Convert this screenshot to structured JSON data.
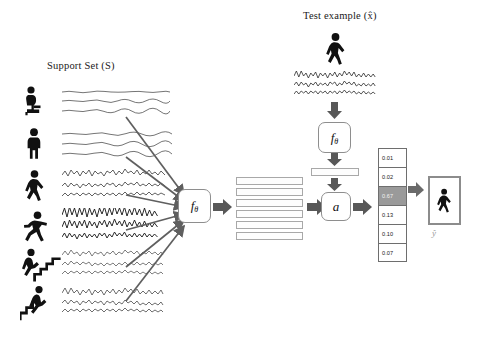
{
  "figure": {
    "type": "method-diagram",
    "title_support": "Support Set (S)",
    "title_test": "Test example (x̂)",
    "prediction_label": "ŷ"
  },
  "support_set": {
    "label": "Support Set (S)",
    "classes": [
      {
        "icon": "person-sitting-icon",
        "name": "sitting",
        "signal_rows": 3,
        "signal_style": "flat-smooth"
      },
      {
        "icon": "person-standing-icon",
        "name": "standing",
        "signal_rows": 3,
        "signal_style": "flat-smooth"
      },
      {
        "icon": "person-walking-icon",
        "name": "walking",
        "signal_rows": 3,
        "signal_style": "medium-noisy"
      },
      {
        "icon": "person-running-icon",
        "name": "running",
        "signal_rows": 3,
        "signal_style": "high-amplitude"
      },
      {
        "icon": "person-upstairs-icon",
        "name": "walking-upstairs",
        "signal_rows": 3,
        "signal_style": "medium-noisy"
      },
      {
        "icon": "person-downstairs-icon",
        "name": "walking-downstairs",
        "signal_rows": 3,
        "signal_style": "medium-noisy"
      }
    ]
  },
  "encoder_support": {
    "name": "f-theta-box",
    "label": "f",
    "subscript": "θ"
  },
  "embeddings": {
    "name": "support-embeddings",
    "count": 6
  },
  "test_branch": {
    "label": "Test example (x̂)",
    "icon": "person-walking-icon",
    "signal_rows": 3,
    "encoder": {
      "label": "f",
      "subscript": "θ"
    },
    "embedding": {
      "name": "test-embedding"
    },
    "attention": {
      "label": "a"
    }
  },
  "probabilities": {
    "name": "class-probability-column",
    "values": [
      "0.01",
      "0.02",
      "0.67",
      "0.13",
      "0.10",
      "0.07"
    ],
    "highlighted_index": 2
  },
  "prediction": {
    "icon": "person-walking-icon",
    "label": "ŷ"
  },
  "colors": {
    "arrow": "#595959",
    "thin_arrow": "#6b6b6b",
    "box_border": "#8e8e8e",
    "highlight": "#9a9a9a",
    "background": "#ffffff",
    "ink": "#111111"
  }
}
